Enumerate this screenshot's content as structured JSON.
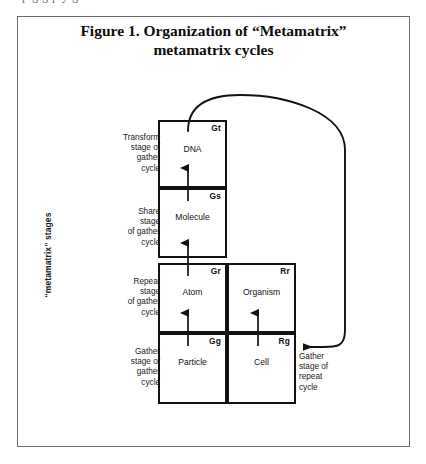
{
  "page": {
    "clipped_top_line": "p g  g         p y  g",
    "background_color": "#ffffff",
    "frame_border_color": "#6e6e72"
  },
  "figure": {
    "title_line1": "Figure 1. Organization of “Metamatrix”",
    "title_line2": "metamatrix cycles",
    "axis_label": "“metamatrix” stages",
    "line_color": "#121212"
  },
  "stage_captions": {
    "transform": "Transform\nstage of\ngather\ncycle",
    "share": "Share\nstage\nof gather\ncycle",
    "repeat": "Repeat\nstage\nof gather\ncycle",
    "gather": "Gather\nstage of\ngather\ncycle",
    "right_gather_repeat": "Gather\nstage of\nrepeat\ncycle"
  },
  "cells": {
    "gt": {
      "code": "Gt",
      "name": "DNA"
    },
    "gs": {
      "code": "Gs",
      "name": "Molecule"
    },
    "gr": {
      "code": "Gr",
      "name": "Atom"
    },
    "gg": {
      "code": "Gg",
      "name": "Particle"
    },
    "rr": {
      "code": "Rr",
      "name": "Organism"
    },
    "rg": {
      "code": "Rg",
      "name": "Cell"
    }
  }
}
